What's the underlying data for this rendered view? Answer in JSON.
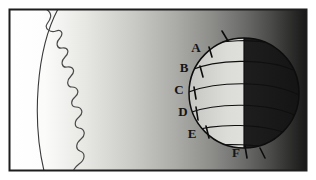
{
  "figure": {
    "frame": {
      "border_color": "#1d1d1d",
      "outer_margin_color": "#ffffff"
    },
    "background": {
      "type": "horizontal-gradient",
      "from_color": "#ffffff",
      "to_color": "#1a1a1a",
      "description": "space brightness falls off with distance from the sun"
    },
    "sun": {
      "name": "sun-limb",
      "body_color": "#fbfbfb",
      "edge_color": "#2a2a2a",
      "surface_label": "",
      "corona_label": "",
      "description": "bright solar limb at left with wavy chromosphere boundary"
    },
    "planet": {
      "name": "planet-sphere",
      "lit_color": "#d6d6d2",
      "dark_color": "#1b1b1b",
      "outline_color": "#111111",
      "center_x": 244,
      "center_y": 93,
      "radius": 55,
      "terminator_label": "",
      "latitude_lines": 6
    },
    "labels": [
      {
        "id": "label-a",
        "text": "A",
        "x": 196,
        "y": 52
      },
      {
        "id": "label-b",
        "text": "B",
        "x": 184,
        "y": 72
      },
      {
        "id": "label-c",
        "text": "C",
        "x": 179,
        "y": 94
      },
      {
        "id": "label-d",
        "text": "D",
        "x": 183,
        "y": 116
      },
      {
        "id": "label-e",
        "text": "E",
        "x": 192,
        "y": 138
      },
      {
        "id": "label-f",
        "text": "F",
        "x": 236,
        "y": 156
      }
    ],
    "tick_marks": [
      {
        "id": "tick-a",
        "label": "A"
      },
      {
        "id": "tick-b",
        "label": "B"
      },
      {
        "id": "tick-c",
        "label": "C"
      },
      {
        "id": "tick-d",
        "label": "D"
      },
      {
        "id": "tick-e",
        "label": "E"
      },
      {
        "id": "tick-f",
        "label": "F"
      },
      {
        "id": "tick-top",
        "label": ""
      },
      {
        "id": "tick-bottom-right",
        "label": ""
      }
    ]
  }
}
